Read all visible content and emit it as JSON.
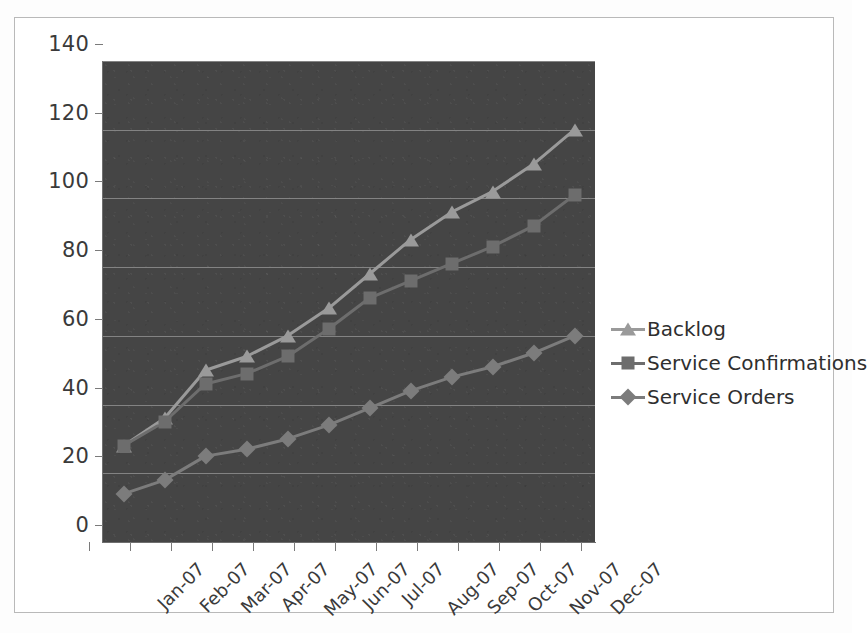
{
  "chart_data": {
    "type": "line",
    "title": "",
    "xlabel": "",
    "ylabel": "",
    "categories": [
      "Jan-07",
      "Feb-07",
      "Mar-07",
      "Apr-07",
      "May-07",
      "Jun-07",
      "Jul-07",
      "Aug-07",
      "Sep-07",
      "Oct-07",
      "Nov-07",
      "Dec-07"
    ],
    "ylim": [
      0,
      140
    ],
    "yticks": [
      0,
      20,
      40,
      60,
      80,
      100,
      120,
      140
    ],
    "grid": true,
    "legend_position": "right",
    "series": [
      {
        "name": "Backlog",
        "marker": "triangle",
        "color": "#9a9a9a",
        "values": [
          28,
          36,
          50,
          54,
          60,
          68,
          78,
          88,
          96,
          102,
          110,
          120
        ]
      },
      {
        "name": "Service Confirmations",
        "marker": "square",
        "color": "#6d6d6d",
        "values": [
          28,
          35,
          46,
          49,
          54,
          62,
          71,
          76,
          81,
          86,
          92,
          101
        ]
      },
      {
        "name": "Service Orders",
        "marker": "diamond",
        "color": "#7c7c7c",
        "values": [
          14,
          18,
          25,
          27,
          30,
          34,
          39,
          44,
          48,
          51,
          55,
          60
        ]
      }
    ]
  },
  "style": {
    "plot_background": "#454545",
    "page_background": "#ffffff",
    "gridline_color": "#8e8e8e",
    "axis_color": "#6f6f6f",
    "tick_label_color": "#3a3a3a"
  }
}
